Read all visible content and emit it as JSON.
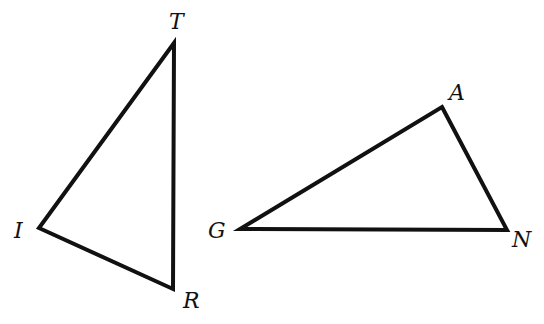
{
  "diagram": {
    "triangles": [
      {
        "name": "TRI",
        "vertices": [
          {
            "label": "T",
            "x": 174,
            "y": 43,
            "label_x": 169,
            "label_y": 29
          },
          {
            "label": "R",
            "x": 173,
            "y": 289,
            "label_x": 183,
            "label_y": 308
          },
          {
            "label": "I",
            "x": 39,
            "y": 228,
            "label_x": 14,
            "label_y": 238
          }
        ]
      },
      {
        "name": "GAN",
        "vertices": [
          {
            "label": "A",
            "x": 442,
            "y": 107,
            "label_x": 449,
            "label_y": 100
          },
          {
            "label": "N",
            "x": 507,
            "y": 230,
            "label_x": 512,
            "label_y": 247
          },
          {
            "label": "G",
            "x": 240,
            "y": 229,
            "label_x": 208,
            "label_y": 238
          }
        ]
      }
    ],
    "stroke_color": "#111111",
    "background": "#ffffff"
  }
}
